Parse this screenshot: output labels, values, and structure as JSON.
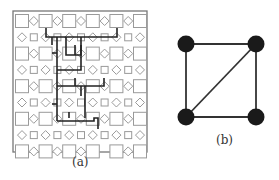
{
  "figure": {
    "panel_a": {
      "label": "(a)",
      "frame": {
        "x": 13,
        "y": 11,
        "w": 134,
        "h": 141,
        "color": "#777777"
      },
      "grid": {
        "rows": 9,
        "cols": 11,
        "origin_x": 22,
        "origin_y": 21,
        "dx": 11.8,
        "dy": 16.3,
        "big_square_size": 13,
        "small_square_size": 7,
        "diamond_size": 4.5,
        "shape_color": "#9a9a9a",
        "omitted": [
          [
            8,
            7
          ]
        ]
      },
      "wiring": {
        "color": "#222222",
        "width": 1.6,
        "segments": [
          [
            [
              46,
              28
            ],
            [
              46,
              37
            ],
            [
              117,
              37
            ],
            [
              117,
              28
            ]
          ],
          [
            [
              57,
              37
            ],
            [
              57,
              121
            ]
          ],
          [
            [
              52,
              37
            ],
            [
              52,
              45
            ]
          ],
          [
            [
              66,
              37
            ],
            [
              66,
              55
            ],
            [
              81,
              55
            ],
            [
              81,
              37
            ]
          ],
          [
            [
              75,
              45
            ],
            [
              75,
              55
            ]
          ],
          [
            [
              57,
              53
            ],
            [
              52,
              53
            ]
          ],
          [
            [
              57,
              70
            ],
            [
              81,
              70
            ],
            [
              81,
              45
            ]
          ],
          [
            [
              57,
              86
            ],
            [
              98,
              86
            ],
            [
              104,
              86
            ],
            [
              104,
              78
            ]
          ],
          [
            [
              81,
              86
            ],
            [
              81,
              96
            ]
          ],
          [
            [
              57,
              104
            ],
            [
              52,
              104
            ]
          ],
          [
            [
              57,
              121
            ],
            [
              94,
              121
            ],
            [
              94,
              118
            ],
            [
              98,
              118
            ],
            [
              98,
              129
            ]
          ],
          [
            [
              69,
              112
            ],
            [
              69,
              118
            ]
          ],
          [
            [
              85,
              86
            ],
            [
              85,
              118
            ]
          ],
          [
            [
              75,
              78
            ],
            [
              75,
              86
            ]
          ]
        ]
      }
    },
    "panel_b": {
      "label": "(b)",
      "node_radius": 8.5,
      "node_color": "#1a1a1a",
      "edge_color": "#333333",
      "nodes": [
        {
          "id": "tl",
          "x": 186,
          "y": 44
        },
        {
          "id": "tr",
          "x": 256,
          "y": 44
        },
        {
          "id": "bl",
          "x": 186,
          "y": 117
        },
        {
          "id": "br",
          "x": 256,
          "y": 117
        }
      ],
      "edges": [
        [
          "tl",
          "tr"
        ],
        [
          "tl",
          "bl"
        ],
        [
          "tr",
          "br"
        ],
        [
          "bl",
          "br"
        ],
        [
          "bl",
          "tr"
        ]
      ]
    }
  }
}
